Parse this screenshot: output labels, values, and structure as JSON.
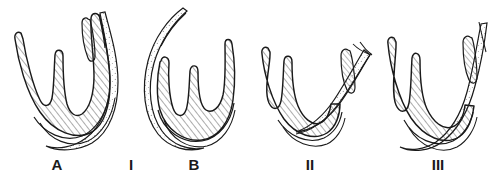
{
  "figure": {
    "background_color": "#ffffff",
    "ink_color": "#1a1a1a",
    "hatch_color": "#3a3a3a",
    "stipple_color": "#8a8a8a",
    "panel_count": 4,
    "label_font_size": "15px",
    "label_font_weight": "bold"
  },
  "panels": [
    {
      "id": "panel-a",
      "label": "A",
      "label_x": 57,
      "label_y": 170,
      "prong_count": 3,
      "shading": "cross-hatched body with stippled right ramus",
      "right_ramus": "long, extends above and to the right",
      "accessory_process": "present, short, on right ramus",
      "description": "Trident element with three prongs, broad hatched basal plate and an outer stippled limb"
    },
    {
      "id": "panel-i",
      "label": "I",
      "label_x": 131,
      "label_y": 170,
      "prong_count": 0,
      "shading": "none",
      "description": "Roman numeral stage label I placed between panels A and B"
    },
    {
      "id": "panel-b",
      "label": "B",
      "label_x": 194,
      "label_y": 170,
      "prong_count": 3,
      "shading": "cross-hatched body with stippled left ramus",
      "right_ramus": "short, curves inward",
      "accessory_process": "absent",
      "description": "Trident element with three prongs and a long stippled limb sweeping up to the left"
    },
    {
      "id": "panel-ii",
      "label": "II",
      "label_x": 310,
      "label_y": 170,
      "prong_count": 3,
      "shading": "cross-hatched body with stippled right ramus",
      "right_ramus": "long, forked, extends up and right",
      "accessory_process": "present, elongate oval on right ramus",
      "description": "Trident element, stage II, with separated stippled right ramus and oval accessory ossicle"
    },
    {
      "id": "panel-iii",
      "label": "III",
      "label_x": 438,
      "label_y": 170,
      "prong_count": 3,
      "shading": "cross-hatched body with stippled right ramus",
      "right_ramus": "long, forked, extends up and right",
      "accessory_process": "present, elongate oval on right ramus",
      "description": "Trident element, stage III, most fully fused form with heavy hatched base"
    }
  ],
  "labels": {
    "a": "A",
    "i": "I",
    "b": "B",
    "ii": "II",
    "iii": "III"
  }
}
